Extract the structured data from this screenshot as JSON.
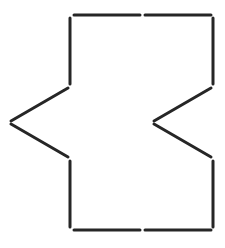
{
  "diagram": {
    "type": "matchstick-figure",
    "canvas": {
      "width": 225,
      "height": 248
    },
    "background": "#ffffff",
    "stroke_color": "#262626",
    "stroke_width": 3,
    "stick_count": 12,
    "sticks": [
      {
        "id": "top-left",
        "x1": 74,
        "y1": 15,
        "x2": 140,
        "y2": 15
      },
      {
        "id": "top-right",
        "x1": 145,
        "y1": 15,
        "x2": 211,
        "y2": 15
      },
      {
        "id": "left-upper-vert",
        "x1": 70,
        "y1": 18,
        "x2": 70,
        "y2": 84
      },
      {
        "id": "right-upper-vert",
        "x1": 213,
        "y1": 18,
        "x2": 213,
        "y2": 84
      },
      {
        "id": "left-upper-diag",
        "x1": 68,
        "y1": 88,
        "x2": 11,
        "y2": 121
      },
      {
        "id": "right-upper-diag",
        "x1": 211,
        "y1": 88,
        "x2": 154,
        "y2": 121
      },
      {
        "id": "left-lower-diag",
        "x1": 11,
        "y1": 124,
        "x2": 68,
        "y2": 157
      },
      {
        "id": "right-lower-diag",
        "x1": 154,
        "y1": 124,
        "x2": 211,
        "y2": 157
      },
      {
        "id": "left-lower-vert",
        "x1": 70,
        "y1": 161,
        "x2": 70,
        "y2": 227
      },
      {
        "id": "right-lower-vert",
        "x1": 213,
        "y1": 161,
        "x2": 213,
        "y2": 227
      },
      {
        "id": "bottom-left",
        "x1": 74,
        "y1": 230,
        "x2": 140,
        "y2": 230
      },
      {
        "id": "bottom-right",
        "x1": 145,
        "y1": 230,
        "x2": 211,
        "y2": 230
      }
    ]
  }
}
